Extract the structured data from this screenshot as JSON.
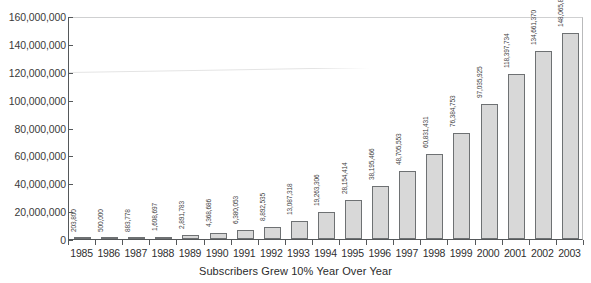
{
  "chart_data": {
    "type": "bar",
    "title": "",
    "xlabel": "Subscribers Grew 10% Year Over Year",
    "ylabel": "",
    "ylim": [
      0,
      160000000
    ],
    "ytick_step": 20000000,
    "grid": false,
    "legend": null,
    "categories": [
      "1985",
      "1986",
      "1987",
      "1988",
      "1989",
      "1990",
      "1991",
      "1992",
      "1993",
      "1994",
      "1995",
      "1996",
      "1997",
      "1998",
      "1999",
      "2000",
      "2001",
      "2002",
      "2003"
    ],
    "values": [
      203800,
      500000,
      883778,
      1608697,
      2891783,
      4368686,
      6380053,
      8892535,
      13087318,
      19263306,
      28154414,
      38195466,
      48705553,
      60831431,
      76384753,
      97035925,
      118397734,
      134661370,
      148065824
    ],
    "value_labels": [
      "203,800",
      "500,000",
      "883,778",
      "1,608,697",
      "2,891,783",
      "4,368,686",
      "6,380,053",
      "8,892,535",
      "13,087,318",
      "19,263,306",
      "28,154,414",
      "38,195,466",
      "48,705,553",
      "60,831,431",
      "76,384,753",
      "97,035,925",
      "118,397,734",
      "134,661,370",
      "148,065,824"
    ],
    "ytick_labels": [
      "160,000,000",
      "140,000,000",
      "120,000,000",
      "100,000,000",
      "80,000,000",
      "60,000,000",
      "40,000,000",
      "20,000,000",
      "0"
    ],
    "colors": {
      "bar_fill": "#d8d8d8",
      "bar_border": "#6e7173",
      "axis": "#55585a",
      "text": "#2b2b2b",
      "background": "#ffffff"
    }
  }
}
